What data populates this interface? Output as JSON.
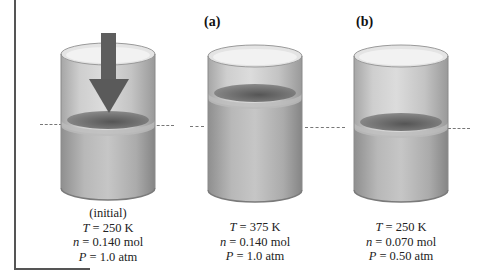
{
  "figure": {
    "panels": [
      {
        "id": "initial",
        "letter": "",
        "caption_title": "(initial)",
        "T_label": "T",
        "T_value": "= 250 K",
        "n_label": "n",
        "n_value": "= 0.140 mol",
        "P_label": "P",
        "P_value": "= 1.0 atm",
        "has_arrow": true
      },
      {
        "id": "a",
        "letter": "(a)",
        "T_label": "T",
        "T_value": "= 375 K",
        "n_label": "n",
        "n_value": "= 0.140 mol",
        "P_label": "P",
        "P_value": "= 1.0 atm"
      },
      {
        "id": "b",
        "letter": "(b)",
        "T_label": "T",
        "T_value": "= 250 K",
        "n_label": "n",
        "n_value": "= 0.070 mol",
        "P_label": "P",
        "P_value": "= 0.50 atm"
      }
    ],
    "colors": {
      "arrow": "#5e5e5e",
      "glass": "#b9b9b9",
      "piston_dark": "#6f6f6f",
      "dashed_line": "#777777"
    }
  }
}
